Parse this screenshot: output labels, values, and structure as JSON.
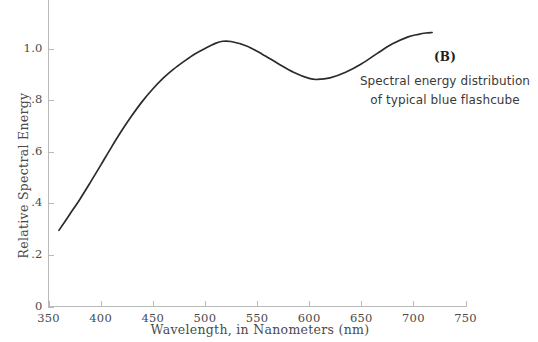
{
  "chart_data": {
    "type": "line",
    "title": "",
    "panel_label": "(B)",
    "caption_lines": [
      "Spectral energy distribution",
      "of typical blue flashcube"
    ],
    "xlabel": "Wavelength, in Nanometers (nm)",
    "ylabel": "Relative Spectral Energy",
    "xlim": [
      350,
      750
    ],
    "ylim": [
      0,
      1.12
    ],
    "grid": false,
    "legend": null,
    "xticks": [
      350,
      400,
      450,
      500,
      550,
      600,
      650,
      700,
      750
    ],
    "xtick_labels": [
      "350",
      "400",
      "450",
      "500",
      "550",
      "600",
      "650",
      "700",
      "750"
    ],
    "yticks": [
      0,
      0.2,
      0.4,
      0.6,
      0.8,
      1.0
    ],
    "ytick_labels": [
      "0",
      ".2",
      ".4",
      ".6",
      ".8",
      "1.0"
    ],
    "series": [
      {
        "name": "typical blue flashcube",
        "color": "#2b2b2b",
        "x": [
          360,
          370,
          380,
          390,
          400,
          410,
          420,
          430,
          440,
          450,
          460,
          470,
          480,
          490,
          500,
          510,
          517,
          525,
          540,
          555,
          570,
          585,
          600,
          608,
          620,
          635,
          650,
          665,
          680,
          695,
          705,
          712,
          718
        ],
        "y": [
          0.295,
          0.355,
          0.415,
          0.48,
          0.547,
          0.615,
          0.68,
          0.74,
          0.795,
          0.843,
          0.885,
          0.92,
          0.95,
          0.978,
          1.0,
          1.02,
          1.028,
          1.027,
          1.01,
          0.978,
          0.942,
          0.908,
          0.884,
          0.88,
          0.886,
          0.908,
          0.94,
          0.98,
          1.018,
          1.045,
          1.055,
          1.06,
          1.062
        ]
      }
    ]
  },
  "axis_title_x": "Wavelength, in Nanometers (nm)",
  "axis_title_y": "Relative Spectral Energy",
  "colors": {
    "curve": "#2b2b2b",
    "axis": "#b9b9b9",
    "text": "#4a4a4a",
    "background": "#ffffff"
  }
}
